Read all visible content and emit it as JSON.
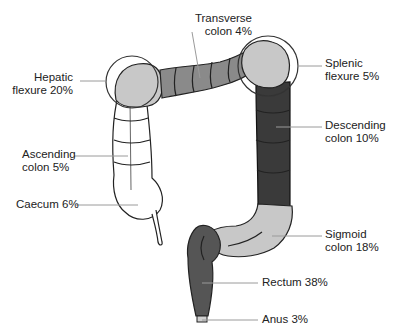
{
  "diagram": {
    "title": "",
    "colors": {
      "white_segment": "#ffffff",
      "light_segment": "#c8c8c8",
      "mid_segment": "#8a8a8a",
      "dark_segment": "#3a3a3a",
      "rectum": "#555555",
      "outline": "#222222",
      "leader_line": "#9a9a9a"
    },
    "labels": [
      {
        "id": "transverse",
        "line1": "Transverse",
        "line2": "colon 4%"
      },
      {
        "id": "hepatic",
        "line1": "Hepatic",
        "line2": "flexure 20%"
      },
      {
        "id": "splenic",
        "line1": "Splenic",
        "line2": "flexure 5%"
      },
      {
        "id": "ascending",
        "line1": "Ascending",
        "line2": "colon 5%"
      },
      {
        "id": "descending",
        "line1": "Descending",
        "line2": "colon 10%"
      },
      {
        "id": "caecum",
        "line1": "Caecum 6%"
      },
      {
        "id": "sigmoid",
        "line1": "Sigmoid",
        "line2": "colon 18%"
      },
      {
        "id": "rectum",
        "line1": "Rectum 38%"
      },
      {
        "id": "anus",
        "line1": "Anus 3%"
      }
    ]
  }
}
